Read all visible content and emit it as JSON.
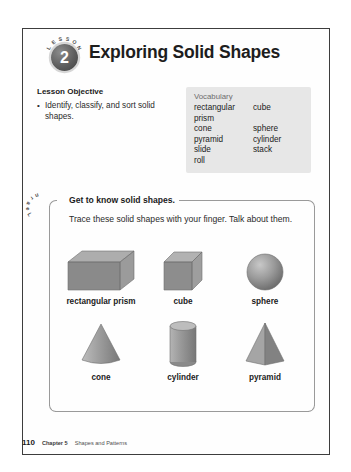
{
  "header": {
    "lesson_word": "LESSON",
    "lesson_number": "2",
    "title": "Exploring Solid Shapes"
  },
  "objective": {
    "heading": "Lesson Objective",
    "items": [
      "Identify, classify, and sort solid shapes."
    ]
  },
  "vocabulary": {
    "title": "Vocabulary",
    "terms": [
      {
        "left": "rectangular prism",
        "right": "cube"
      },
      {
        "left": "cone",
        "right": "sphere"
      },
      {
        "left": "pyramid",
        "right": "cylinder"
      },
      {
        "left": "slide",
        "right": "stack"
      },
      {
        "left": "roll",
        "right": ""
      }
    ]
  },
  "learn": {
    "tab_label": "Learn",
    "heading": "Get to know solid shapes.",
    "instructions": "Trace these solid shapes with your finger. Talk about them.",
    "shapes_row1": [
      {
        "label": "rectangular prism",
        "icon": "rectangular-prism-icon"
      },
      {
        "label": "cube",
        "icon": "cube-icon"
      },
      {
        "label": "sphere",
        "icon": "sphere-icon"
      }
    ],
    "shapes_row2": [
      {
        "label": "cone",
        "icon": "cone-icon"
      },
      {
        "label": "cylinder",
        "icon": "cylinder-icon"
      },
      {
        "label": "pyramid",
        "icon": "pyramid-icon"
      }
    ]
  },
  "footer": {
    "page_number": "110",
    "chapter": "Chapter 5",
    "chapter_title": "Shapes and Patterns"
  },
  "colors": {
    "frame": "#3d3d3d",
    "vocabulary_background": "#e7e7e7",
    "learn_border": "#9a9a9a",
    "shape_fill": "#8f8f8f"
  }
}
